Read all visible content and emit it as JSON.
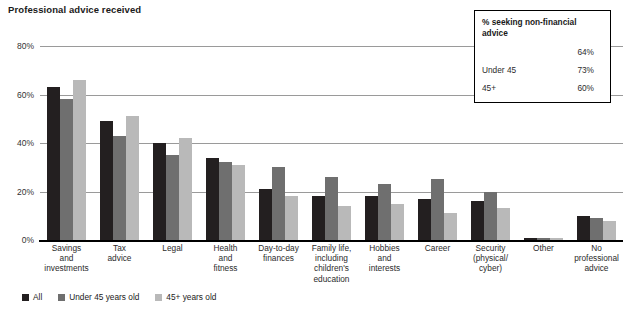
{
  "chart_data": {
    "type": "bar",
    "title": "Professional advice received",
    "xlabel": "",
    "ylabel": "",
    "ylim": [
      0,
      80
    ],
    "yticks": [
      "0%",
      "20%",
      "40%",
      "60%",
      "80%"
    ],
    "ytick_values": [
      0,
      20,
      40,
      60,
      80
    ],
    "grid": true,
    "legend_position": "bottom-left",
    "categories": [
      "Savings and investments",
      "Tax advice",
      "Legal",
      "Health and fitness",
      "Day-to-day finances",
      "Family life, including children's education",
      "Hobbies and interests",
      "Career",
      "Security (physical/cyber)",
      "Other",
      "No professional advice"
    ],
    "category_lines": [
      [
        "Savings",
        "and",
        "investments"
      ],
      [
        "Tax",
        "advice"
      ],
      [
        "Legal"
      ],
      [
        "Health",
        "and",
        "fitness"
      ],
      [
        "Day-to-day",
        "finances"
      ],
      [
        "Family life,",
        "including",
        "children's",
        "education"
      ],
      [
        "Hobbies",
        "and",
        "interests"
      ],
      [
        "Career"
      ],
      [
        "Security",
        "(physical/",
        "cyber)"
      ],
      [
        "Other"
      ],
      [
        "No",
        "professional",
        "advice"
      ]
    ],
    "series": [
      {
        "name": "All",
        "color": "#231f20",
        "values": [
          63,
          49,
          40,
          34,
          21,
          18,
          18,
          17,
          16,
          1,
          10
        ]
      },
      {
        "name": "Under 45 years old",
        "color": "#6f6f6f",
        "values": [
          58,
          43,
          35,
          32,
          30,
          26,
          23,
          25,
          20,
          1,
          9
        ]
      },
      {
        "name": "45+ years old",
        "color": "#b9b9b9",
        "values": [
          66,
          51,
          42,
          31,
          18,
          14,
          15,
          11,
          13,
          1,
          8
        ]
      }
    ],
    "inset": {
      "title": "% seeking non-financial advice",
      "rows": [
        {
          "label": "",
          "value": "64%"
        },
        {
          "label": "Under 45",
          "value": "73%"
        },
        {
          "label": "45+",
          "value": "60%"
        }
      ]
    },
    "legend": [
      {
        "label": "All",
        "color": "#231f20"
      },
      {
        "label": "Under 45 years old",
        "color": "#6f6f6f"
      },
      {
        "label": "45+ years old",
        "color": "#b9b9b9"
      }
    ]
  }
}
